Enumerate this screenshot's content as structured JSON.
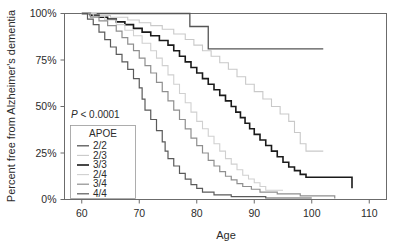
{
  "figure": {
    "annotation": {
      "p_value_prefix": "P",
      "p_value_text": " < 0.0001"
    },
    "legend": {
      "title": "APOE"
    }
  },
  "chart_data": {
    "type": "line",
    "subtype": "kaplan-meier-survival",
    "title": "",
    "xlabel": "Age",
    "ylabel": "Percent free from Alzheimer's dementia",
    "xlim": [
      57,
      113
    ],
    "ylim": [
      0,
      100
    ],
    "xticks": [
      60,
      70,
      80,
      90,
      100,
      110
    ],
    "xtick_labels": [
      "60",
      "70",
      "80",
      "90",
      "100",
      "110"
    ],
    "yticks": [
      0,
      25,
      50,
      75,
      100
    ],
    "ytick_labels": [
      "0%",
      "25%",
      "50%",
      "75%",
      "100%"
    ],
    "grid": false,
    "legend_position": "inside-left-lower",
    "legend_title": "APOE",
    "annotations": [
      {
        "text": "P < 0.0001",
        "x": 63,
        "y": 45
      }
    ],
    "series": [
      {
        "name": "2/2",
        "color": "#555555",
        "width": 1.3,
        "points": [
          [
            60.0,
            100
          ],
          [
            78.8,
            100
          ],
          [
            78.8,
            93
          ],
          [
            82.0,
            93
          ],
          [
            82.0,
            81
          ],
          [
            102.0,
            81
          ]
        ]
      },
      {
        "name": "2/3",
        "color": "#c9c9c9",
        "width": 1.1,
        "points": [
          [
            60.0,
            100
          ],
          [
            62.5,
            100
          ],
          [
            62.5,
            99
          ],
          [
            65,
            99
          ],
          [
            65,
            98
          ],
          [
            68,
            98
          ],
          [
            68,
            96.5
          ],
          [
            70,
            96.5
          ],
          [
            70,
            95
          ],
          [
            72,
            95
          ],
          [
            72,
            93.5
          ],
          [
            74,
            93.5
          ],
          [
            74,
            91.5
          ],
          [
            76,
            91.5
          ],
          [
            76,
            89
          ],
          [
            78,
            89
          ],
          [
            78,
            86
          ],
          [
            79.5,
            86
          ],
          [
            79.5,
            83
          ],
          [
            81,
            83
          ],
          [
            81,
            80
          ],
          [
            82.5,
            80
          ],
          [
            82.5,
            77
          ],
          [
            84,
            77
          ],
          [
            84,
            73.5
          ],
          [
            85.5,
            73.5
          ],
          [
            85.5,
            70
          ],
          [
            87,
            70
          ],
          [
            87,
            66
          ],
          [
            88.5,
            66
          ],
          [
            88.5,
            62
          ],
          [
            90,
            62
          ],
          [
            90,
            58
          ],
          [
            91.5,
            58
          ],
          [
            91.5,
            54
          ],
          [
            93,
            54
          ],
          [
            93,
            50
          ],
          [
            94.5,
            50
          ],
          [
            94.5,
            46
          ],
          [
            96,
            46
          ],
          [
            96,
            42
          ],
          [
            97,
            42
          ],
          [
            97,
            36
          ],
          [
            98,
            36
          ],
          [
            98,
            30
          ],
          [
            99,
            30
          ],
          [
            99,
            26
          ],
          [
            102,
            26
          ],
          [
            102,
            26
          ]
        ]
      },
      {
        "name": "3/3",
        "color": "#1a1a1a",
        "width": 1.6,
        "points": [
          [
            60.0,
            100
          ],
          [
            61.5,
            100
          ],
          [
            61.5,
            99
          ],
          [
            63,
            99
          ],
          [
            63,
            98
          ],
          [
            64.5,
            98
          ],
          [
            64.5,
            97
          ],
          [
            66,
            97
          ],
          [
            66,
            95.5
          ],
          [
            67.5,
            95.5
          ],
          [
            67.5,
            94
          ],
          [
            69,
            94
          ],
          [
            69,
            92
          ],
          [
            70.5,
            92
          ],
          [
            70.5,
            90
          ],
          [
            72,
            90
          ],
          [
            72,
            88
          ],
          [
            73.5,
            88
          ],
          [
            73.5,
            85.5
          ],
          [
            75,
            85.5
          ],
          [
            75,
            83
          ],
          [
            76,
            83
          ],
          [
            76,
            80
          ],
          [
            77,
            80
          ],
          [
            77,
            77
          ],
          [
            78,
            77
          ],
          [
            78,
            74
          ],
          [
            79,
            74
          ],
          [
            79,
            71
          ],
          [
            80,
            71
          ],
          [
            80,
            68
          ],
          [
            81,
            68
          ],
          [
            81,
            65
          ],
          [
            82,
            65
          ],
          [
            82,
            62
          ],
          [
            83,
            62
          ],
          [
            83,
            59
          ],
          [
            84,
            59
          ],
          [
            84,
            56
          ],
          [
            85,
            56
          ],
          [
            85,
            53
          ],
          [
            86,
            53
          ],
          [
            86,
            50
          ],
          [
            86.8,
            50
          ],
          [
            86.8,
            47
          ],
          [
            87.6,
            47
          ],
          [
            87.6,
            44
          ],
          [
            88.4,
            44
          ],
          [
            88.4,
            41
          ],
          [
            89.2,
            41
          ],
          [
            89.2,
            38
          ],
          [
            90,
            38
          ],
          [
            90,
            35
          ],
          [
            91,
            35
          ],
          [
            91,
            32
          ],
          [
            92,
            32
          ],
          [
            92,
            29
          ],
          [
            93,
            29
          ],
          [
            93,
            26
          ],
          [
            94,
            26
          ],
          [
            94,
            23
          ],
          [
            95,
            23
          ],
          [
            95,
            20
          ],
          [
            96,
            20
          ],
          [
            96,
            17.5
          ],
          [
            97,
            17.5
          ],
          [
            97,
            15.5
          ],
          [
            98,
            15.5
          ],
          [
            98,
            13.5
          ],
          [
            99,
            13.5
          ],
          [
            99,
            12
          ],
          [
            107,
            12
          ],
          [
            107,
            6
          ]
        ]
      },
      {
        "name": "2/4",
        "color": "#d0d0d0",
        "width": 1.1,
        "points": [
          [
            60.0,
            100
          ],
          [
            62,
            100
          ],
          [
            62,
            98.5
          ],
          [
            64,
            98.5
          ],
          [
            64,
            96.5
          ],
          [
            66,
            96.5
          ],
          [
            66,
            94
          ],
          [
            67.5,
            94
          ],
          [
            67.5,
            91
          ],
          [
            69,
            91
          ],
          [
            69,
            88
          ],
          [
            70.5,
            88
          ],
          [
            70.5,
            84
          ],
          [
            72,
            84
          ],
          [
            72,
            80
          ],
          [
            73,
            80
          ],
          [
            73,
            76
          ],
          [
            74,
            76
          ],
          [
            74,
            72
          ],
          [
            75,
            72
          ],
          [
            75,
            67
          ],
          [
            76,
            67
          ],
          [
            76,
            62
          ],
          [
            77,
            62
          ],
          [
            77,
            57
          ],
          [
            78,
            57
          ],
          [
            78,
            52
          ],
          [
            79,
            52
          ],
          [
            79,
            47
          ],
          [
            80,
            47
          ],
          [
            80,
            42
          ],
          [
            81,
            42
          ],
          [
            81,
            38
          ],
          [
            82,
            38
          ],
          [
            82,
            34
          ],
          [
            83,
            34
          ],
          [
            83,
            30
          ],
          [
            84,
            30
          ],
          [
            84,
            26
          ],
          [
            85,
            26
          ],
          [
            85,
            22
          ],
          [
            86,
            22
          ],
          [
            86,
            19
          ],
          [
            87,
            19
          ],
          [
            87,
            16
          ],
          [
            88,
            16
          ],
          [
            88,
            13
          ],
          [
            89,
            13
          ],
          [
            89,
            11
          ],
          [
            90,
            11
          ],
          [
            90,
            9
          ],
          [
            91,
            9
          ],
          [
            91,
            7
          ],
          [
            92,
            7
          ],
          [
            92,
            5
          ],
          [
            95,
            5
          ]
        ]
      },
      {
        "name": "3/4",
        "color": "#8f8f8f",
        "width": 1.2,
        "points": [
          [
            60.0,
            100
          ],
          [
            61.5,
            100
          ],
          [
            61.5,
            98
          ],
          [
            63,
            98
          ],
          [
            63,
            96
          ],
          [
            64.5,
            96
          ],
          [
            64.5,
            93.5
          ],
          [
            66,
            93.5
          ],
          [
            66,
            90.5
          ],
          [
            67,
            90.5
          ],
          [
            67,
            87
          ],
          [
            68,
            87
          ],
          [
            68,
            83.5
          ],
          [
            69,
            83.5
          ],
          [
            69,
            80
          ],
          [
            70,
            80
          ],
          [
            70,
            76
          ],
          [
            71,
            76
          ],
          [
            71,
            72
          ],
          [
            72,
            72
          ],
          [
            72,
            68
          ],
          [
            73,
            68
          ],
          [
            73,
            63
          ],
          [
            74,
            63
          ],
          [
            74,
            58
          ],
          [
            75,
            58
          ],
          [
            75,
            53
          ],
          [
            76,
            53
          ],
          [
            76,
            48
          ],
          [
            77,
            48
          ],
          [
            77,
            43
          ],
          [
            78,
            43
          ],
          [
            78,
            38
          ],
          [
            79,
            38
          ],
          [
            79,
            33
          ],
          [
            80,
            33
          ],
          [
            80,
            29
          ],
          [
            81,
            29
          ],
          [
            81,
            25
          ],
          [
            82,
            25
          ],
          [
            82,
            21
          ],
          [
            83,
            21
          ],
          [
            83,
            18
          ],
          [
            84,
            18
          ],
          [
            84,
            15
          ],
          [
            85,
            15
          ],
          [
            85,
            12.5
          ],
          [
            86,
            12.5
          ],
          [
            86,
            10.5
          ],
          [
            87,
            10.5
          ],
          [
            87,
            8.5
          ],
          [
            88,
            8.5
          ],
          [
            88,
            7
          ],
          [
            89.5,
            7
          ],
          [
            89.5,
            5.5
          ],
          [
            91,
            5.5
          ],
          [
            91,
            4
          ],
          [
            94,
            4
          ],
          [
            94,
            3
          ],
          [
            98,
            3
          ],
          [
            98,
            2
          ],
          [
            104,
            2
          ],
          [
            104,
            0.5
          ]
        ]
      },
      {
        "name": "4/4",
        "color": "#5a5a5a",
        "width": 1.2,
        "points": [
          [
            60.0,
            100
          ],
          [
            61,
            100
          ],
          [
            61,
            97
          ],
          [
            62,
            97
          ],
          [
            62,
            94
          ],
          [
            63,
            94
          ],
          [
            63,
            90
          ],
          [
            64,
            90
          ],
          [
            64,
            86
          ],
          [
            65,
            86
          ],
          [
            65,
            82
          ],
          [
            66,
            82
          ],
          [
            66,
            78
          ],
          [
            67,
            78
          ],
          [
            67,
            74
          ],
          [
            68,
            74
          ],
          [
            68,
            70
          ],
          [
            69,
            70
          ],
          [
            69,
            65
          ],
          [
            70,
            65
          ],
          [
            70,
            60
          ],
          [
            70.5,
            60
          ],
          [
            70.5,
            54
          ],
          [
            71,
            54
          ],
          [
            71,
            48
          ],
          [
            72,
            48
          ],
          [
            72,
            43
          ],
          [
            73,
            43
          ],
          [
            73,
            37
          ],
          [
            74,
            37
          ],
          [
            74,
            31
          ],
          [
            74.5,
            31
          ],
          [
            74.5,
            26
          ],
          [
            75,
            26
          ],
          [
            75,
            22
          ],
          [
            76,
            22
          ],
          [
            76,
            18
          ],
          [
            77,
            18
          ],
          [
            77,
            14
          ],
          [
            78,
            14
          ],
          [
            78,
            11
          ],
          [
            79,
            11
          ],
          [
            79,
            8
          ],
          [
            80,
            8
          ],
          [
            80,
            6
          ],
          [
            81,
            6
          ],
          [
            81,
            4
          ],
          [
            83,
            4
          ],
          [
            83,
            2.5
          ],
          [
            86,
            2.5
          ],
          [
            86,
            1.5
          ],
          [
            92,
            1.5
          ],
          [
            92,
            0.8
          ],
          [
            100,
            0.8
          ]
        ]
      }
    ]
  }
}
